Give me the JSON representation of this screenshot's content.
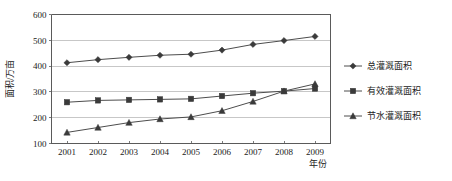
{
  "chart_data": {
    "type": "line",
    "title": "",
    "xlabel": "年份",
    "ylabel": "面积/万亩",
    "categories": [
      "2001",
      "2002",
      "2003",
      "2004",
      "2005",
      "2006",
      "2007",
      "2008",
      "2009"
    ],
    "x": [
      2001,
      2002,
      2003,
      2004,
      2005,
      2006,
      2007,
      2008,
      2009
    ],
    "ylim": [
      100,
      600
    ],
    "yticks": [
      100,
      200,
      300,
      400,
      500,
      600
    ],
    "ytick_labels": [
      "100",
      "200",
      "300",
      "400",
      "500",
      "600"
    ],
    "grid": "horizontal",
    "legend_position": "right",
    "series": [
      {
        "name": "总灌溉面积",
        "marker": "diamond",
        "color": "#3a3a3a",
        "values": [
          413,
          425,
          434,
          442,
          446,
          462,
          484,
          499,
          515
        ]
      },
      {
        "name": "有效灌溉面积",
        "marker": "square",
        "color": "#3a3a3a",
        "values": [
          260,
          267,
          269,
          271,
          273,
          284,
          295,
          303,
          313
        ]
      },
      {
        "name": "节水灌溉面积",
        "marker": "triangle",
        "color": "#8a8a8a",
        "values": [
          143,
          162,
          181,
          195,
          203,
          227,
          263,
          303,
          331
        ]
      }
    ]
  },
  "axes": {
    "y_axis_label": "面积/万亩",
    "x_axis_label": "年份"
  },
  "legend": {
    "items": [
      {
        "label": "总灌溉面积",
        "marker": "diamond-marker"
      },
      {
        "label": "有效灌溉面积",
        "marker": "square-marker"
      },
      {
        "label": "节水灌溉面积",
        "marker": "triangle-marker"
      }
    ]
  },
  "colors": {
    "axis": "#5a5a5a",
    "grid": "#b9b9b9",
    "series_dark": "#3a3a3a",
    "series_light": "#8a8a8a",
    "background": "#ffffff"
  }
}
